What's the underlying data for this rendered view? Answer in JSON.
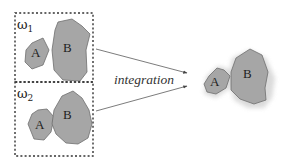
{
  "diagram": {
    "panels": [
      {
        "id": "panel-1",
        "label": "ω",
        "subscript": "1",
        "regions": [
          {
            "name": "A",
            "label": "A"
          },
          {
            "name": "B",
            "label": "B"
          }
        ]
      },
      {
        "id": "panel-2",
        "label": "ω",
        "subscript": "2",
        "regions": [
          {
            "name": "A",
            "label": "A"
          },
          {
            "name": "B",
            "label": "B"
          }
        ]
      }
    ],
    "operation_label": "integration",
    "result": {
      "regions": [
        {
          "name": "A",
          "label": "A"
        },
        {
          "name": "B",
          "label": "B"
        }
      ]
    },
    "colors": {
      "region_fill": "#a6a6a6",
      "region_stroke": "#6e6e6e",
      "box_stroke": "#333333",
      "arrow": "#444444",
      "halo": "#d6d6d6"
    }
  }
}
